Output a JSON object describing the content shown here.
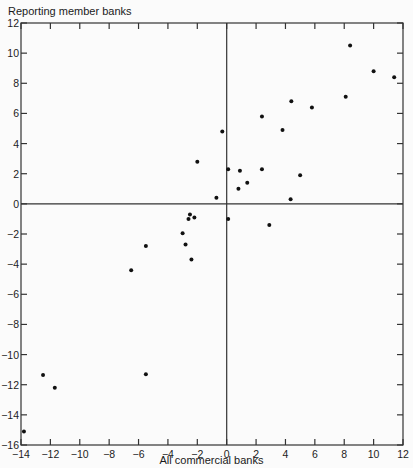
{
  "chart_data": {
    "type": "scatter",
    "title": "",
    "xlabel": "All commercial banks",
    "ylabel": "Reporting member banks",
    "xlim": [
      -14,
      12
    ],
    "ylim": [
      -16,
      12
    ],
    "xticks": [
      -14,
      -12,
      -10,
      -8,
      -6,
      -4,
      -2,
      0,
      2,
      4,
      6,
      8,
      10,
      12
    ],
    "yticks": [
      12,
      10,
      8,
      6,
      4,
      2,
      0,
      -2,
      -4,
      -6,
      -8,
      -10,
      -12,
      -14,
      -16
    ],
    "grid": false,
    "reference_lines": {
      "x": 0,
      "y": 0
    },
    "points": [
      {
        "x": 8.4,
        "y": 10.5
      },
      {
        "x": 10.0,
        "y": 8.8
      },
      {
        "x": 11.4,
        "y": 8.4
      },
      {
        "x": 8.1,
        "y": 7.1
      },
      {
        "x": 4.4,
        "y": 6.8
      },
      {
        "x": 5.8,
        "y": 6.4
      },
      {
        "x": 2.4,
        "y": 5.8
      },
      {
        "x": 3.8,
        "y": 4.9
      },
      {
        "x": -0.3,
        "y": 4.8
      },
      {
        "x": -2.0,
        "y": 2.8
      },
      {
        "x": 0.1,
        "y": 2.3
      },
      {
        "x": 0.9,
        "y": 2.2
      },
      {
        "x": 2.4,
        "y": 2.3
      },
      {
        "x": 5.0,
        "y": 1.9
      },
      {
        "x": 1.4,
        "y": 1.4
      },
      {
        "x": 0.8,
        "y": 1.0
      },
      {
        "x": -0.7,
        "y": 0.4
      },
      {
        "x": 4.35,
        "y": 0.3
      },
      {
        "x": 0.1,
        "y": -1.0
      },
      {
        "x": 2.9,
        "y": -1.4
      },
      {
        "x": -2.5,
        "y": -0.7
      },
      {
        "x": -2.2,
        "y": -0.9
      },
      {
        "x": -2.6,
        "y": -1.0
      },
      {
        "x": -3.0,
        "y": -1.95
      },
      {
        "x": -2.8,
        "y": -2.7
      },
      {
        "x": -2.4,
        "y": -3.7
      },
      {
        "x": -5.5,
        "y": -2.8
      },
      {
        "x": -6.5,
        "y": -4.4
      },
      {
        "x": -12.5,
        "y": -11.35
      },
      {
        "x": -11.7,
        "y": -12.2
      },
      {
        "x": -5.5,
        "y": -11.3
      },
      {
        "x": -13.8,
        "y": -15.1
      }
    ]
  }
}
